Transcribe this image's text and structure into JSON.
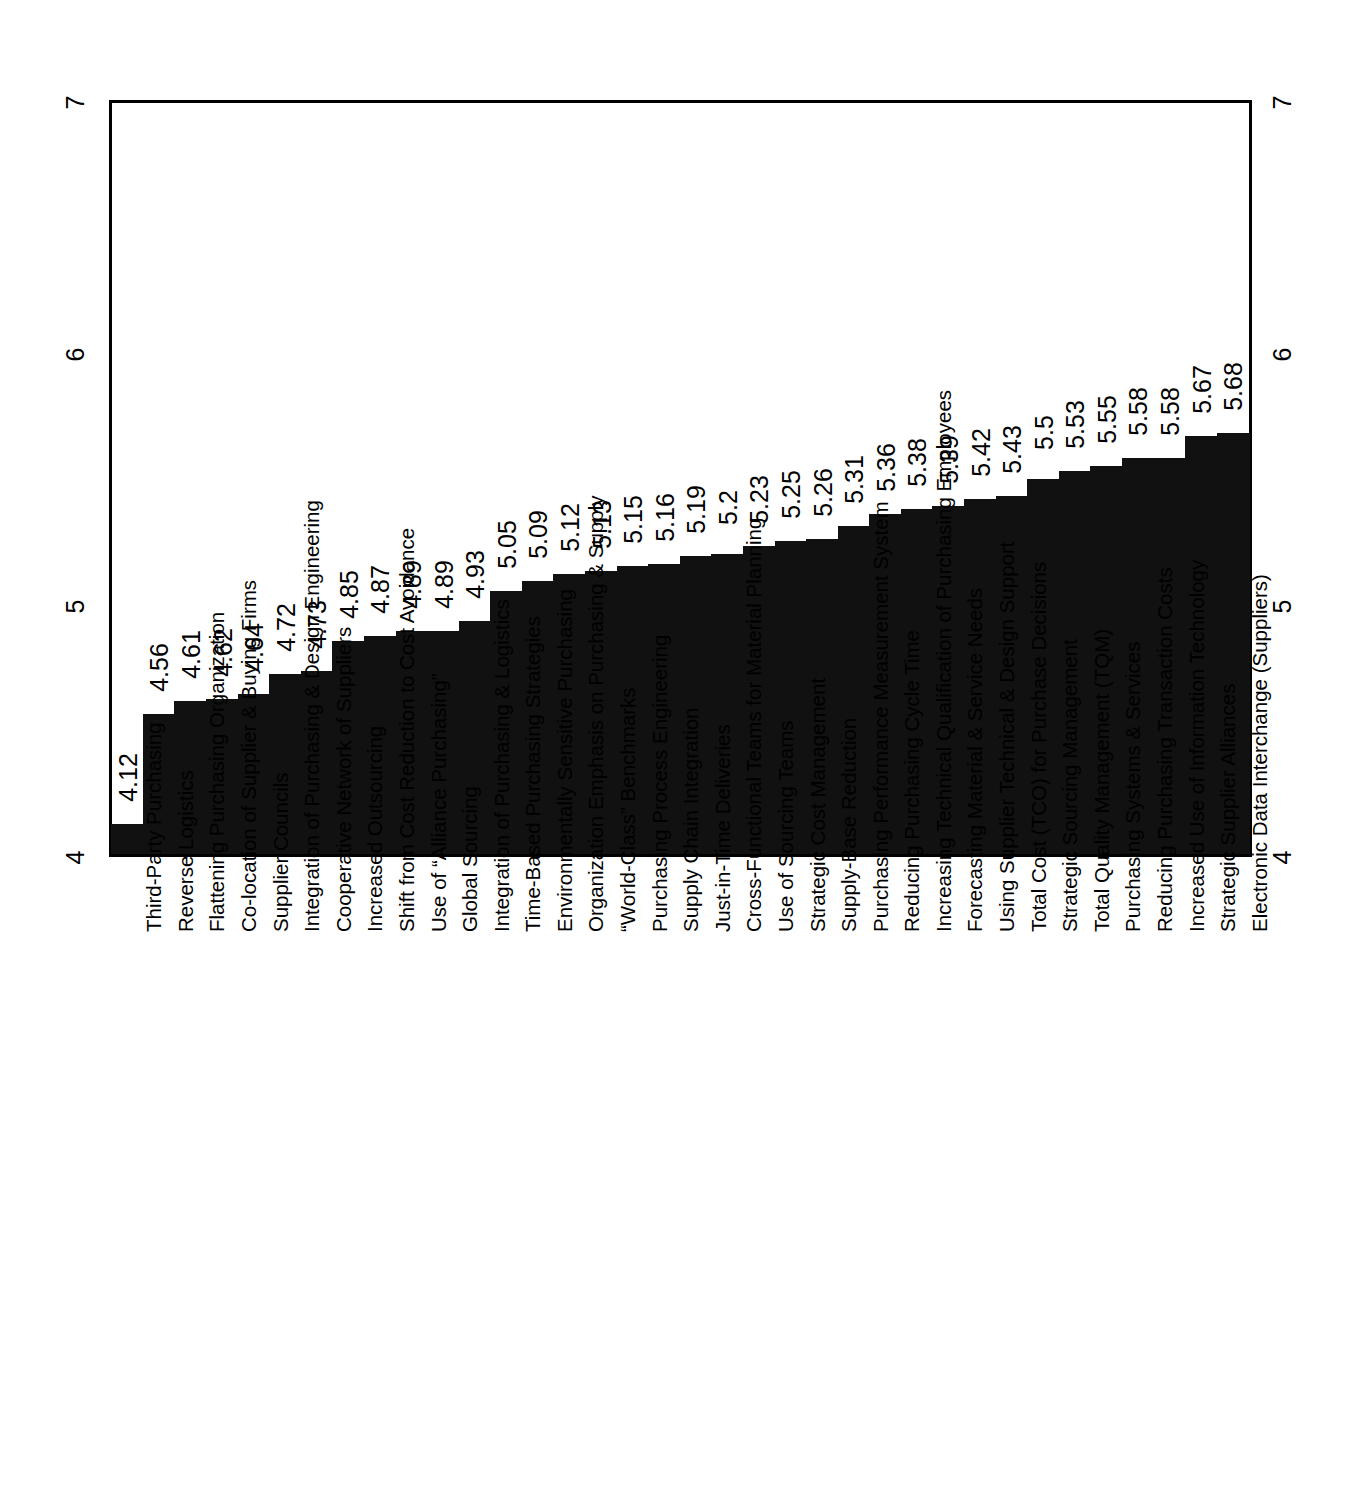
{
  "chart_data": {
    "type": "bar",
    "title": "",
    "subtitle": "",
    "xlabel": "",
    "ylabel": "",
    "ylim": [
      4,
      7
    ],
    "yticks": [
      4,
      5,
      6,
      7
    ],
    "ytick_labels": [
      "4",
      "5",
      "6",
      "7"
    ],
    "ytick_labels_right": [
      "4",
      "5",
      "6",
      "7"
    ],
    "grid": false,
    "legend": null,
    "orientation": "vertical",
    "bar_color": "#111111",
    "value_labels": true,
    "sorted": "ascending",
    "categories": [
      "Third-Party Purchasing",
      "Reverse Logistics",
      "Flattening Purchasing Organization",
      "Co-location of Supplier & Buying Firms",
      "Supplier Councils",
      "Integration of Purchasing & Design Engineering",
      "Cooperative Network of Suppliers",
      "Increased Outsourcing",
      "Shift from Cost Reduction to Cost Avoidance",
      "Use of “Alliance Purchasing”",
      "Global Sourcing",
      "Integration of Purchasing & Logistics",
      "Time-Based Purchasing Strategies",
      "Environmentally Sensitive Purchasing",
      "Organization Emphasis on Purchasing & Supply",
      "“World-Class” Benchmarks",
      "Purchasing Process Engineering",
      "Supply Chain Integration",
      "Just-in-Time Deliveries",
      "Cross-Functional Teams for Material Planning",
      "Use of Sourcing Teams",
      "Strategic Cost Management",
      "Supply-Base Reduction",
      "Purchasing Performance Measurement System",
      "Reducing Purchasing Cycle Time",
      "Increasing Technical Qualification of Purchasing Employees",
      "Forecasting Material & Service Needs",
      "Using Supplier Technical & Design Support",
      "Total Cost (TCO) for Purchase Decisions",
      "Strategic Sourcing Management",
      "Total Quality Management (TQM)",
      "Purchasing Systems & Services",
      "Reducing Purchasing Transaction Costs",
      "Increased Use of Information Technology",
      "Strategic Supplier Alliances",
      "Electronic Data Interchange (Suppliers)"
    ],
    "values": [
      4.12,
      4.56,
      4.61,
      4.62,
      4.64,
      4.72,
      4.73,
      4.85,
      4.87,
      4.89,
      4.89,
      4.93,
      5.05,
      5.09,
      5.12,
      5.13,
      5.15,
      5.16,
      5.19,
      5.2,
      5.23,
      5.25,
      5.26,
      5.31,
      5.36,
      5.38,
      5.39,
      5.42,
      5.43,
      5.5,
      5.53,
      5.55,
      5.58,
      5.58,
      5.67,
      5.68
    ],
    "value_label_texts": [
      "4.12",
      "4.56",
      "4.61",
      "4.62",
      "4.64",
      "4.72",
      "4.73",
      "4.85",
      "4.87",
      "4.89",
      "4.89",
      "4.93",
      "5.05",
      "5.09",
      "5.12",
      "5.13",
      "5.15",
      "5.16",
      "5.19",
      "5.2",
      "5.23",
      "5.25",
      "5.26",
      "5.31",
      "5.36",
      "5.38",
      "5.39",
      "5.42",
      "5.43",
      "5.5",
      "5.53",
      "5.55",
      "5.58",
      "5.58",
      "5.67",
      "5.68"
    ]
  }
}
